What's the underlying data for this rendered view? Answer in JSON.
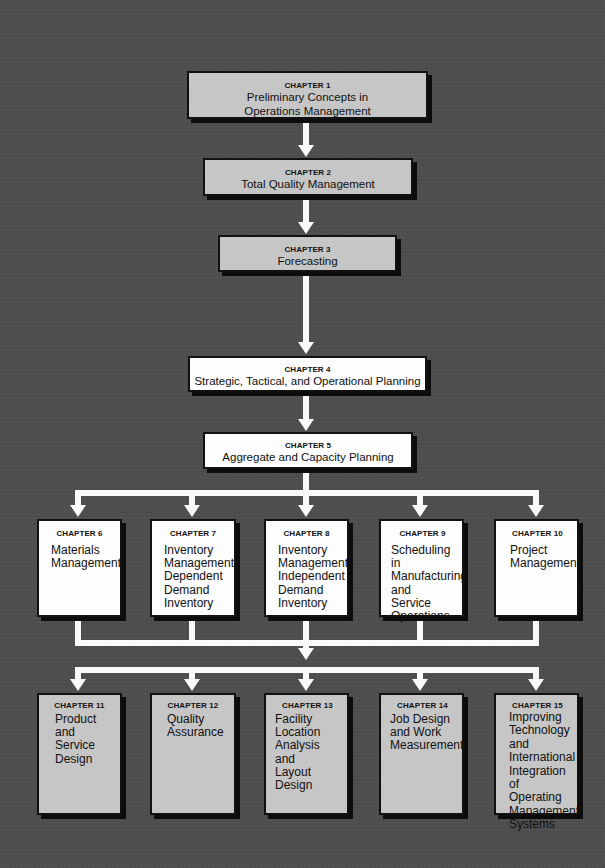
{
  "diagram": {
    "colors": {
      "background": "#4f4f4f",
      "gray_box": "#c6c6c6",
      "white_box": "#fdfdfd",
      "arrow": "#fafafa",
      "border": "#111111"
    },
    "chain": [
      {
        "chapter": "CHAPTER 1",
        "title": "Preliminary Concepts in Operations Management",
        "style": "gray"
      },
      {
        "chapter": "CHAPTER 2",
        "title": "Total Quality Management",
        "style": "gray"
      },
      {
        "chapter": "CHAPTER 3",
        "title": "Forecasting",
        "style": "gray"
      },
      {
        "chapter": "CHAPTER 4",
        "title": "Strategic, Tactical, and Operational Planning",
        "style": "white"
      },
      {
        "chapter": "CHAPTER 5",
        "title": "Aggregate and Capacity Planning",
        "style": "white"
      }
    ],
    "row_middle": [
      {
        "chapter": "CHAPTER 6",
        "title": "Materials\nManagement",
        "style": "white"
      },
      {
        "chapter": "CHAPTER 7",
        "title": "Inventory\nManagement:\nDependent\nDemand\nInventory",
        "style": "white"
      },
      {
        "chapter": "CHAPTER 8",
        "title": "Inventory\nManagement:\nIndependent\nDemand\nInventory",
        "style": "white"
      },
      {
        "chapter": "CHAPTER 9",
        "title": "Scheduling in\nManufacturing\nand\nService\nOperations",
        "style": "white"
      },
      {
        "chapter": "CHAPTER 10",
        "title": "Project\nManagement",
        "style": "white"
      }
    ],
    "row_bottom": [
      {
        "chapter": "CHAPTER 11",
        "title": "Product\nand\nService\nDesign",
        "style": "gray"
      },
      {
        "chapter": "CHAPTER 12",
        "title": "Quality\nAssurance",
        "style": "gray"
      },
      {
        "chapter": "CHAPTER 13",
        "title": "Facility\nLocation\nAnalysis\nand\nLayout Design",
        "style": "gray"
      },
      {
        "chapter": "CHAPTER 14",
        "title": "Job Design\nand Work\nMeasurement",
        "style": "gray"
      },
      {
        "chapter": "CHAPTER 15",
        "title": "Improving\nTechnology\nand\nInternational\nIntegration of\nOperating\nManagement\nSystems",
        "style": "gray"
      }
    ]
  }
}
